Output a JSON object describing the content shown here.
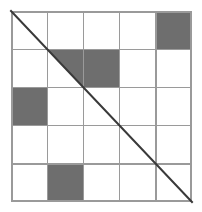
{
  "figure": {
    "type": "grid-diagram",
    "background_color": "#ffffff"
  },
  "grid": {
    "rows": 5,
    "columns": 5,
    "origin_x": 11,
    "origin_y": 11,
    "width": 181,
    "height": 191,
    "cell_width": 36.2,
    "cell_height": 38.2,
    "line_color": "#9a9a9a",
    "line_width": 1.4,
    "border_color": "#9a9a9a",
    "border_width": 1.6,
    "cell_background": "#ffffff"
  },
  "shading": {
    "fill_color": "#6e6e6e",
    "label": "shaded cell"
  },
  "diagonal": {
    "label": "main diagonal",
    "color": "#3a3a3a",
    "width": 2,
    "from_row": 1,
    "from_column": 1,
    "to_row": 5,
    "to_column": 5,
    "direction": "top-left to bottom-right"
  },
  "cells": [
    {
      "row": 1,
      "column": 5,
      "state": "filled",
      "shape": "full"
    },
    {
      "row": 2,
      "column": 2,
      "state": "filled",
      "shape": "upper-right-triangle"
    },
    {
      "row": 2,
      "column": 3,
      "state": "filled",
      "shape": "full"
    },
    {
      "row": 3,
      "column": 1,
      "state": "filled",
      "shape": "full"
    },
    {
      "row": 5,
      "column": 2,
      "state": "filled",
      "shape": "full"
    }
  ],
  "counts": {
    "filled_full": 4,
    "filled_partial": 1,
    "total_cells": 25
  }
}
